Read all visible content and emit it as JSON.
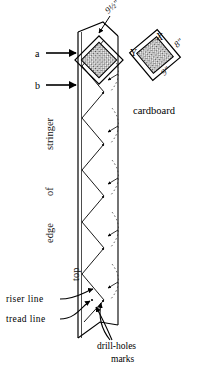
{
  "figure": {
    "background": "#ffffff",
    "ink": "#000000"
  },
  "labels": {
    "point_a": "a",
    "point_b": "b",
    "cardboard": "cardboard",
    "corner_x": "X",
    "corner_y": "Y",
    "riser_line": "riser line",
    "tread_line": "tread line",
    "drill_holes_line1": "drill-holes",
    "drill_holes_line2": "marks"
  },
  "vertical_labels": {
    "stringer": "stringer",
    "of": "of",
    "edge": "edge",
    "top": "top"
  },
  "dimensions": {
    "stringer_template": "9½\"",
    "cardboard_width": "8\"",
    "cardboard_height": "9\""
  }
}
